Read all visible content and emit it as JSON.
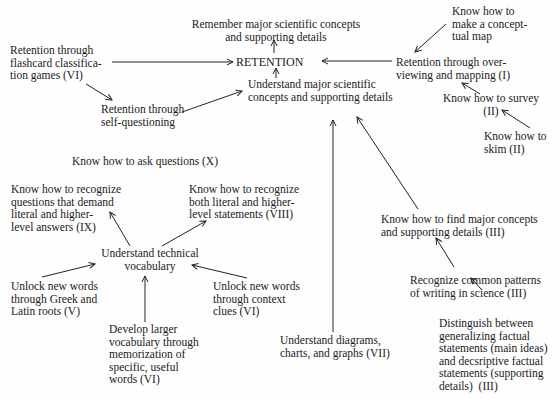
{
  "diagram": {
    "title": "RETENTION",
    "nodes": {
      "retention": "RETENTION",
      "remember": "Remember major scientific concepts\nand supporting details",
      "understand_major": "Understand major scientific\nconcepts and supporting details",
      "flashcard": "Retention through\nflashcard classifica-\ntion games (VI)",
      "self_questioning": "Retention through\nself-questioning",
      "overviewing": "Retention through over-\nviewing and mapping (I)",
      "conceptual_map": "Know how to\nmake a concept-\ntual map",
      "survey": "Know how to survey\n(II)",
      "skim": "Know how to\nskim (II)",
      "ask_questions": "Know how to ask questions (X)",
      "recognize_questions": "Know how to recognize\nquestions that demand\nliteral and higher-\nlevel answers (IX)",
      "recognize_statements": "Know how to recognize\nboth literal and higher-\nlevel statements (VIII)",
      "technical_vocab": "Understand technical\nvocabulary",
      "greek_latin": "Unlock new words\nthrough Greek and\nLatin roots (V)",
      "context_clues": "Unlock new words\nthrough context\nclues (VI)",
      "memorization": "Develop larger\nvocabulary through\nmemorization of\nspecific, useful\nwords (VI)",
      "diagrams": "Understand diagrams,\ncharts, and graphs (VII)",
      "find_major": "Know how to find major concepts\nand supporting details (III)",
      "patterns": "Recognize common patterns\nof writing in science (III)",
      "distinguish": "Distinguish between\ngeneralizing factual\nstatements (main ideas)\nand decsriptive factual\nstatements (supporting\ndetails)  (III)"
    },
    "edges": [
      {
        "from": "retention",
        "to": "remember"
      },
      {
        "from": "flashcard",
        "to": "retention"
      },
      {
        "from": "overviewing",
        "to": "retention"
      },
      {
        "from": "understand_major",
        "to": "retention"
      },
      {
        "from": "flashcard",
        "to": "self_questioning"
      },
      {
        "from": "self_questioning",
        "to": "understand_major"
      },
      {
        "from": "conceptual_map",
        "to": "overviewing"
      },
      {
        "from": "survey",
        "to": "overviewing"
      },
      {
        "from": "skim",
        "to": "survey"
      },
      {
        "from": "diagrams",
        "to": "understand_major"
      },
      {
        "from": "find_major",
        "to": "understand_major"
      },
      {
        "from": "patterns",
        "to": "find_major"
      },
      {
        "from": "distinguish",
        "to": "patterns"
      },
      {
        "from": "technical_vocab",
        "to": "recognize_questions"
      },
      {
        "from": "technical_vocab",
        "to": "recognize_statements"
      },
      {
        "from": "greek_latin",
        "to": "technical_vocab"
      },
      {
        "from": "context_clues",
        "to": "technical_vocab"
      },
      {
        "from": "memorization",
        "to": "technical_vocab"
      }
    ]
  }
}
